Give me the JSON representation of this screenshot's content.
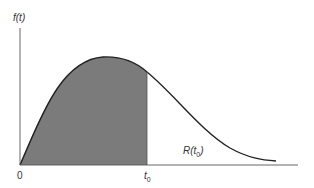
{
  "diagram": {
    "y_axis_label": "f(t)",
    "origin_label": "0",
    "t0_label": "t",
    "t0_subscript": "0",
    "region_label": "R(t",
    "region_label_sub": "0",
    "region_label_close": ")",
    "colors": {
      "shaded": "#7b7b7b",
      "curve": "#222222",
      "axis": "#555555"
    }
  }
}
